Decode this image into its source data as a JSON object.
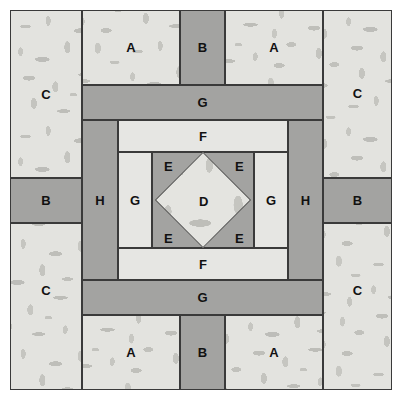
{
  "diagram": {
    "type": "quilt-block",
    "canvas": {
      "width": 405,
      "height": 400
    },
    "colors": {
      "print_light": "#e3e3df",
      "solid_light": "#e6e6e3",
      "solid_medium": "#a3a3a1",
      "solid_dark": "#9b9b99",
      "outline": "#3a3a3a",
      "label_text": "#111111",
      "background": "#ffffff"
    },
    "pieces": [
      {
        "id": "c-top-left",
        "label": "C",
        "fabric": "print",
        "x": 10,
        "y": 10,
        "w": 72,
        "h": 168
      },
      {
        "id": "a-top-left",
        "label": "A",
        "fabric": "print",
        "x": 82,
        "y": 10,
        "w": 98,
        "h": 75
      },
      {
        "id": "b-top",
        "label": "B",
        "fabric": "medium",
        "x": 180,
        "y": 10,
        "w": 45,
        "h": 75
      },
      {
        "id": "a-top-right",
        "label": "A",
        "fabric": "print",
        "x": 225,
        "y": 10,
        "w": 98,
        "h": 75
      },
      {
        "id": "c-top-right",
        "label": "C",
        "fabric": "print",
        "x": 323,
        "y": 10,
        "w": 69,
        "h": 168
      },
      {
        "id": "g-top",
        "label": "G",
        "fabric": "medium",
        "x": 82,
        "y": 85,
        "w": 241,
        "h": 35
      },
      {
        "id": "f-top",
        "label": "F",
        "fabric": "light",
        "x": 118,
        "y": 120,
        "w": 170,
        "h": 32
      },
      {
        "id": "g-left",
        "label": "G",
        "fabric": "light",
        "x": 118,
        "y": 152,
        "w": 34,
        "h": 96
      },
      {
        "id": "g-right",
        "label": "G",
        "fabric": "light",
        "x": 254,
        "y": 152,
        "w": 34,
        "h": 96
      },
      {
        "id": "f-bottom",
        "label": "F",
        "fabric": "light",
        "x": 118,
        "y": 248,
        "w": 170,
        "h": 32
      },
      {
        "id": "g-bottom",
        "label": "G",
        "fabric": "medium",
        "x": 82,
        "y": 280,
        "w": 241,
        "h": 35
      },
      {
        "id": "h-left",
        "label": "H",
        "fabric": "medium",
        "x": 82,
        "y": 120,
        "w": 36,
        "h": 160
      },
      {
        "id": "h-right",
        "label": "H",
        "fabric": "medium",
        "x": 288,
        "y": 120,
        "w": 35,
        "h": 160
      },
      {
        "id": "b-left",
        "label": "B",
        "fabric": "medium",
        "x": 10,
        "y": 178,
        "w": 72,
        "h": 45
      },
      {
        "id": "b-right",
        "label": "B",
        "fabric": "medium",
        "x": 323,
        "y": 178,
        "w": 69,
        "h": 45
      },
      {
        "id": "c-bottom-left",
        "label": "C",
        "fabric": "print",
        "x": 10,
        "y": 223,
        "w": 72,
        "h": 167
      },
      {
        "id": "c-bottom-right",
        "label": "C",
        "fabric": "print",
        "x": 323,
        "y": 223,
        "w": 69,
        "h": 167
      },
      {
        "id": "a-bottom-left",
        "label": "A",
        "fabric": "print",
        "x": 82,
        "y": 315,
        "w": 98,
        "h": 75
      },
      {
        "id": "b-bottom",
        "label": "B",
        "fabric": "medium",
        "x": 180,
        "y": 315,
        "w": 45,
        "h": 75
      },
      {
        "id": "a-bottom-right",
        "label": "A",
        "fabric": "print",
        "x": 225,
        "y": 315,
        "w": 98,
        "h": 75
      }
    ],
    "center": {
      "e_block": {
        "id": "e-block",
        "fabric": "medium",
        "x": 152,
        "y": 152,
        "w": 102,
        "h": 96
      },
      "e_labels": [
        {
          "id": "e-top-left",
          "label": "E",
          "x": 164,
          "y": 159
        },
        {
          "id": "e-top-right",
          "label": "E",
          "x": 235,
          "y": 159
        },
        {
          "id": "e-bottom-left",
          "label": "E",
          "x": 164,
          "y": 231
        },
        {
          "id": "e-bottom-right",
          "label": "E",
          "x": 235,
          "y": 231
        }
      ],
      "d_patch": {
        "id": "d-diamond",
        "label": "D",
        "fabric": "print",
        "cx": 203,
        "cy": 200,
        "size": 68
      }
    },
    "legend_keys": [
      "A",
      "B",
      "C",
      "D",
      "E",
      "F",
      "G",
      "H"
    ]
  }
}
